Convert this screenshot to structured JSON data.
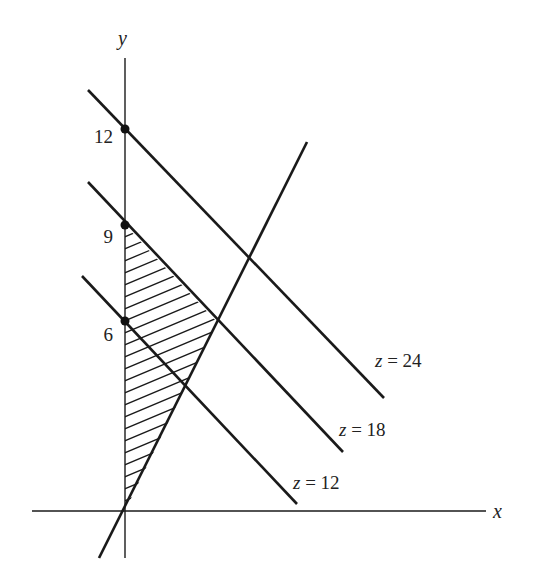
{
  "diagram": {
    "type": "linear-programming-feasible-region",
    "axes": {
      "x_label": "x",
      "y_label": "y"
    },
    "y_tick_labels": [
      {
        "value": "12",
        "y": 129
      },
      {
        "value": "9",
        "y": 225
      },
      {
        "value": "6",
        "y": 321
      }
    ],
    "objective_lines": [
      {
        "label": "z = 24",
        "intercept": 12
      },
      {
        "label": "z = 18",
        "intercept": 9
      },
      {
        "label": "z = 12",
        "intercept": 6
      }
    ],
    "constraint_line": "steep line through origin",
    "shaded_region": "triangle bounded by y-axis, z = 18 line and steep line through origin",
    "colors": {
      "ink": "#1a1a1a",
      "background": "#ffffff"
    }
  }
}
